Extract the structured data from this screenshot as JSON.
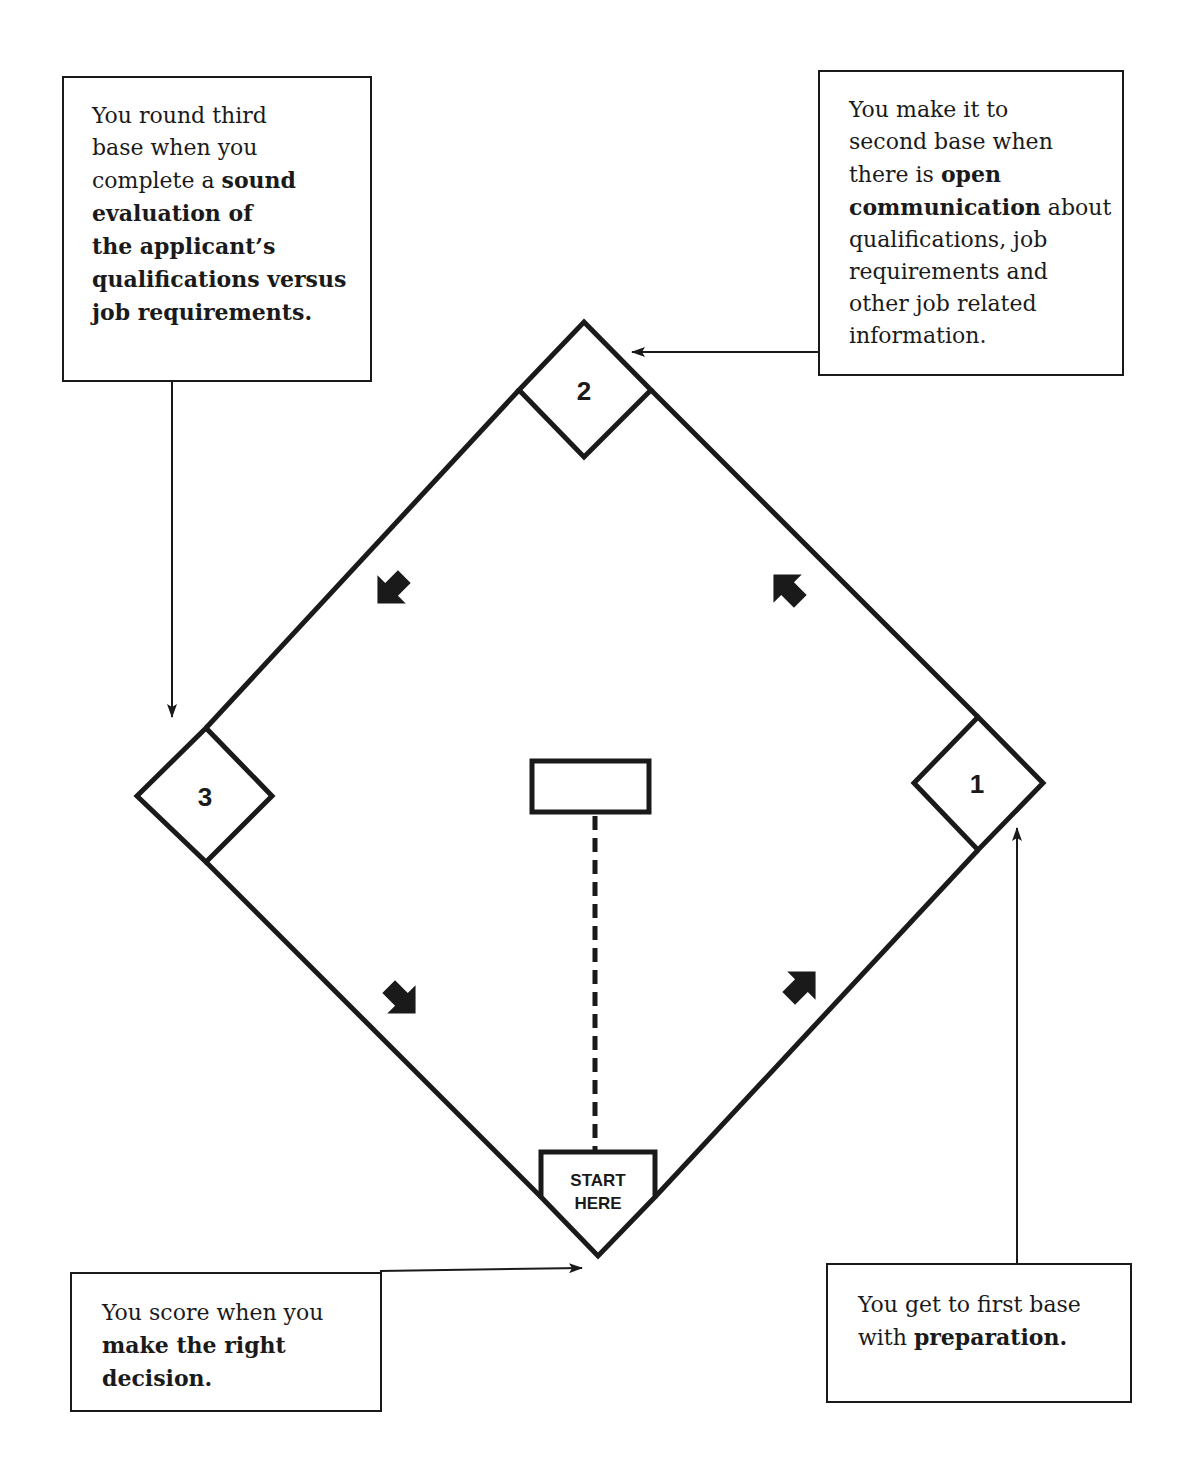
{
  "diagram": {
    "type": "baseball-diamond-process",
    "colors": {
      "ink": "#1a1a1a",
      "background": "#ffffff"
    },
    "bases": [
      {
        "id": "first",
        "label": "1"
      },
      {
        "id": "second",
        "label": "2"
      },
      {
        "id": "third",
        "label": "3"
      }
    ],
    "home_plate": {
      "line1": "START",
      "line2": "HERE"
    },
    "direction_arrows": [
      "home-to-first",
      "first-to-second",
      "second-to-third",
      "third-to-home"
    ]
  },
  "callouts": {
    "third_base": {
      "parts": [
        {
          "text": "You round third base when you complete a ",
          "bold": false
        },
        {
          "text": "sound evaluation of the applicant's qualifications versus job requirements.",
          "bold": true
        }
      ],
      "lines": [
        "You round third",
        "base when you",
        "complete a |sound|",
        "|evaluation of|",
        "|the applicant’s|",
        "|qualifications versus|",
        "|job requirements.|"
      ]
    },
    "second_base": {
      "lines": [
        "You make it to",
        "second base when",
        "there is |open|",
        "|communication| about",
        "qualifications, job",
        "requirements and",
        "other job related",
        "information."
      ]
    },
    "home": {
      "lines": [
        "You score when you",
        "|make the right|",
        "|decision.|"
      ]
    },
    "first_base": {
      "lines": [
        "You get to first base",
        "with |preparation.|"
      ]
    }
  }
}
